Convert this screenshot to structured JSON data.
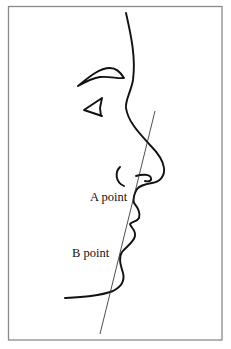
{
  "figure": {
    "type": "facial-profile-diagram",
    "labels": {
      "a_point": "A point",
      "b_point": "B point"
    },
    "colors": {
      "background": "#ffffff",
      "frame": "#8a8a8a",
      "ink": "#111111"
    }
  }
}
